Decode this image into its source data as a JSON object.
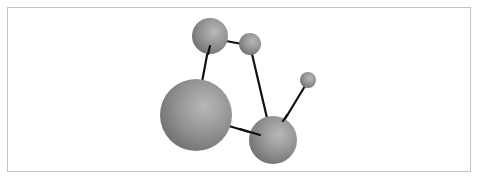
{
  "diagram": {
    "type": "ball-and-stick molecular model",
    "background": "#ffffff",
    "frame_border_color": "#c4c4c4",
    "bond_color": "#111111",
    "sphere_color": "#8a8a8a",
    "atoms": [
      {
        "id": "atom-top-left",
        "cx": 210,
        "cy": 36,
        "r": 18
      },
      {
        "id": "atom-top-small",
        "cx": 250,
        "cy": 44,
        "r": 11
      },
      {
        "id": "atom-large",
        "cx": 196,
        "cy": 115,
        "r": 36
      },
      {
        "id": "atom-lower-right",
        "cx": 273,
        "cy": 140,
        "r": 24
      },
      {
        "id": "atom-tiny",
        "cx": 308,
        "cy": 80,
        "r": 8
      }
    ],
    "bonds": [
      {
        "from": "atom-top-left",
        "to": "atom-large",
        "x1": 208,
        "y1": 50,
        "x2": 202,
        "y2": 82
      },
      {
        "from": "atom-top-left",
        "to": "atom-top-small",
        "x1": 226,
        "y1": 41,
        "x2": 242,
        "y2": 44
      },
      {
        "from": "atom-top-small",
        "to": "atom-lower-right",
        "x1": 252,
        "y1": 54,
        "x2": 267,
        "y2": 118
      },
      {
        "from": "atom-large",
        "to": "atom-lower-right",
        "x1": 229,
        "y1": 126,
        "x2": 259,
        "y2": 135
      },
      {
        "from": "atom-lower-right",
        "to": "atom-tiny",
        "x1": 285,
        "y1": 119,
        "x2": 305,
        "y2": 86
      }
    ]
  }
}
